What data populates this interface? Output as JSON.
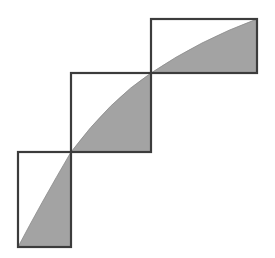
{
  "diagram": {
    "title": "",
    "colors": {
      "background": "#ffffff",
      "stroke": "#3c3c3c",
      "shade": "#a3a3a3"
    },
    "shapes": [
      {
        "id": "rect-bottom",
        "x": 18,
        "y": 152,
        "width": 53,
        "height": 95,
        "curve": "M18,247 Q40,205 71,152",
        "shade": "M18,247 Q40,205 71,152 L71,247 Z"
      },
      {
        "id": "rect-middle",
        "x": 71,
        "y": 73,
        "width": 80,
        "height": 79,
        "curve": "M71,152 Q110,100 151,73",
        "shade": "M71,152 Q110,100 151,73 L151,152 Z"
      },
      {
        "id": "rect-top",
        "x": 151,
        "y": 19,
        "width": 106,
        "height": 54,
        "curve": "M151,73 Q200,40 257,19",
        "shade": "M151,73 Q200,40 257,19 L257,73 Z"
      }
    ]
  }
}
